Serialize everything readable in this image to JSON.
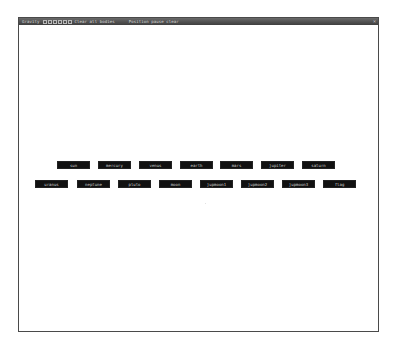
{
  "window": {
    "title_segments": [
      "Gravity",
      "Clear all bodies",
      "Position pause clear"
    ],
    "title_box_count": 6,
    "close_glyph": "×"
  },
  "buttons_row1": [
    "sun",
    "mercury",
    "venus",
    "earth",
    "mars",
    "jupiter",
    "saturn"
  ],
  "buttons_row2": [
    "uranus",
    "neptune",
    "pluto",
    "moon",
    "jupmoon1",
    "jupmoon2",
    "jupmoon3",
    "flag"
  ],
  "colors": {
    "button_bg": "#111111",
    "button_text": "#cfcfcf",
    "titlebar": "#4e4e4e",
    "canvas": "#ffffff"
  }
}
